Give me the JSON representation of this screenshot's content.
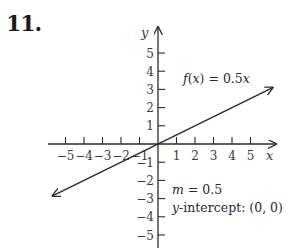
{
  "problem": {
    "number": "11."
  },
  "chart_data": {
    "type": "line",
    "title": "",
    "xlabel": "x",
    "ylabel": "y",
    "xlim": [
      -5.5,
      6
    ],
    "ylim": [
      -5.5,
      6
    ],
    "x_ticks": [
      -5,
      -4,
      -3,
      -2,
      -1,
      1,
      2,
      3,
      4,
      5
    ],
    "y_ticks": [
      -5,
      -4,
      -3,
      -2,
      -1,
      1,
      2,
      3,
      4,
      5
    ],
    "x_tick_labels": [
      "−5",
      "−4",
      "−3",
      "−2",
      "−1",
      "1",
      "2",
      "3",
      "4",
      "5"
    ],
    "y_tick_labels": [
      "−5",
      "−4",
      "−3",
      "−2",
      "−1",
      "1",
      "2",
      "3",
      "4",
      "5"
    ],
    "grid": false,
    "series": [
      {
        "name": "f(x) = 0.5x",
        "slope": 0.5,
        "intercept": 0,
        "x": [
          -5.7,
          6.2
        ],
        "y": [
          -2.85,
          3.1
        ],
        "arrows": "both"
      }
    ],
    "annotations": [
      {
        "text": "f(x) = 0.5x",
        "x": 1.3,
        "y": 3.5
      },
      {
        "text": "m = 0.5",
        "x": 1.0,
        "y": -2.6
      },
      {
        "text": "y-intercept: (0, 0)",
        "x": 1.0,
        "y": -3.7
      }
    ]
  },
  "labels": {
    "function_label": "f(x) = 0.5x",
    "slope_label": "m = 0.5",
    "intercept_label": "y-intercept: (0, 0)"
  },
  "colors": {
    "ink": "#2a2a2a",
    "background": "#ffffff"
  }
}
